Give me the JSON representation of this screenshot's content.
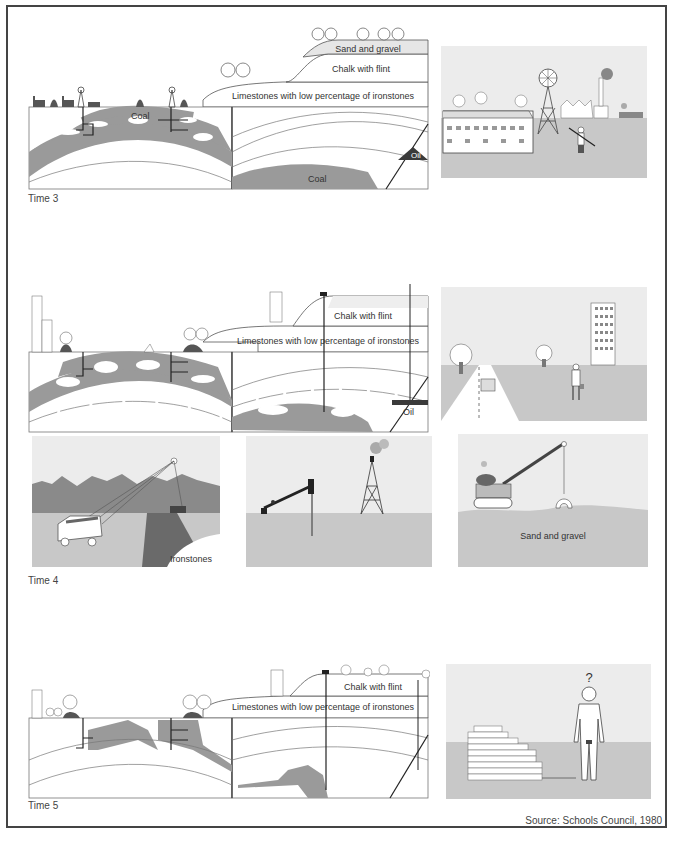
{
  "figure": {
    "source": "Source: Schools Council, 1980",
    "colors": {
      "coal_grey": "#9a9a9a",
      "dark": "#444444",
      "sky": "#ececec",
      "ground": "#c8c8c8",
      "oil": "#3a3a3a"
    },
    "rows": [
      {
        "label": "Time 3",
        "cross_section": {
          "strata_labels": [
            "Sand and gravel",
            "Chalk with flint",
            "Limestones with low percentage of ironstones"
          ],
          "deposit_labels": [
            "Coal",
            "Coal",
            "Oil"
          ]
        },
        "scene": "Mining town: terraced houses, pithead winding tower, factory chimneys, miner with pickaxe"
      },
      {
        "label": "Time 4",
        "cross_section": {
          "strata_labels": [
            "Chalk with flint",
            "Limestones with low percentage of ironstones"
          ],
          "deposit_labels": [
            "Oil"
          ]
        },
        "scene": "Modern town: road with car, trees, office block, businessman",
        "extraction_panels": [
          {
            "name": "ironstone-quarry",
            "label": "Ironstones"
          },
          {
            "name": "oil-field",
            "label": ""
          },
          {
            "name": "gravel-pit",
            "label": "Sand and gravel"
          }
        ]
      },
      {
        "label": "Time 5",
        "cross_section": {
          "strata_labels": [
            "Chalk with flint",
            "Limestones with low percentage of ironstones"
          ],
          "deposit_labels": []
        },
        "scene": "Exhausted resources: brick pile and naked person",
        "scene_symbol": "?"
      }
    ]
  }
}
